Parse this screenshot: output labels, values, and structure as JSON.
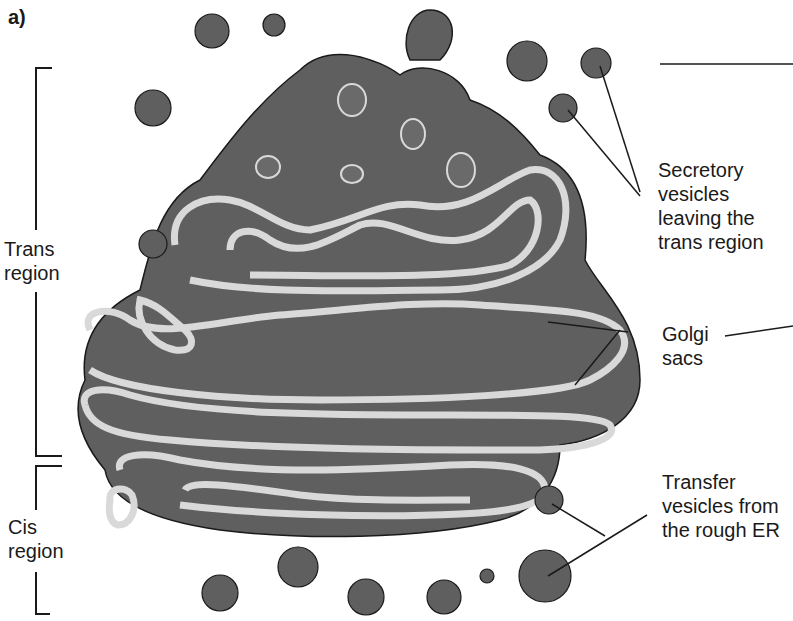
{
  "panel_label": "a)",
  "left_brackets": {
    "trans": {
      "line1": "Trans",
      "line2": "region"
    },
    "cis": {
      "line1": "Cis",
      "line2": "region"
    }
  },
  "callouts": {
    "secretory": {
      "line1": "Secretory",
      "line2": "vesicles",
      "line3": "leaving the",
      "line4": "trans region"
    },
    "golgi": {
      "line1": "Golgi",
      "line2": "sacs"
    },
    "transfer": {
      "line1": "Transfer",
      "line2": "vesicles from",
      "line3": "the rough ER"
    }
  },
  "colors": {
    "organelle_fill": "#5f5f5f",
    "membrane": "#d9d9d9",
    "stroke": "#1a1a1a",
    "background": "#ffffff"
  }
}
